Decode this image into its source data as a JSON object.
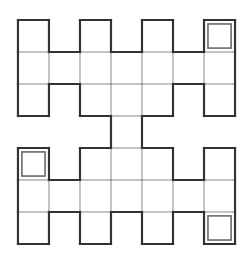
{
  "puzzle": {
    "rows": 7,
    "cols": 7,
    "cell_width": 31.57,
    "cell_height": 32.57,
    "grid_rows": [
      [
        1,
        0,
        1,
        0,
        1,
        0,
        1
      ],
      [
        1,
        1,
        1,
        1,
        1,
        1,
        1
      ],
      [
        1,
        0,
        1,
        1,
        1,
        0,
        1
      ],
      [
        0,
        0,
        0,
        1,
        0,
        0,
        0
      ],
      [
        1,
        0,
        1,
        1,
        1,
        0,
        1
      ],
      [
        1,
        1,
        1,
        1,
        1,
        1,
        1
      ],
      [
        1,
        0,
        1,
        0,
        1,
        0,
        1
      ]
    ],
    "marked_cells": [
      {
        "row": 0,
        "col": 6
      },
      {
        "row": 4,
        "col": 0
      },
      {
        "row": 6,
        "col": 6
      }
    ],
    "colors": {
      "thick_line": "#333333",
      "thin_line": "#888888",
      "mark_line": "#666666",
      "background": "#ffffff"
    }
  }
}
